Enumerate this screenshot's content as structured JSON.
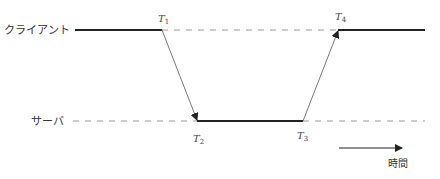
{
  "diagram": {
    "type": "timing-sequence",
    "lanes": [
      {
        "id": "client",
        "label": "クライアント",
        "y": 30
      },
      {
        "id": "server",
        "label": "サーバ",
        "y": 121
      }
    ],
    "time_points": [
      {
        "id": "T1",
        "base": "T",
        "sub": "1",
        "lane": "client",
        "x": 162
      },
      {
        "id": "T2",
        "base": "T",
        "sub": "2",
        "lane": "server",
        "x": 197
      },
      {
        "id": "T3",
        "base": "T",
        "sub": "3",
        "lane": "server",
        "x": 303
      },
      {
        "id": "T4",
        "base": "T",
        "sub": "4",
        "lane": "client",
        "x": 338
      }
    ],
    "messages": [
      {
        "from": "T1",
        "to": "T2",
        "direction": "client-to-server"
      },
      {
        "from": "T3",
        "to": "T4",
        "direction": "server-to-client"
      }
    ],
    "time_axis": {
      "label": "時間"
    },
    "colors": {
      "active_line": "#222222",
      "idle_dash": "#999999",
      "message_line": "#777777",
      "text": "#333333"
    }
  }
}
